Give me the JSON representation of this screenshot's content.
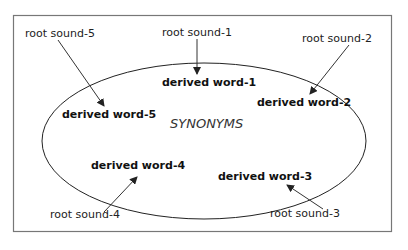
{
  "diagram": {
    "center_label": "SYNONYMS",
    "root_sounds": [
      "root sound-1",
      "root sound-2",
      "root sound-3",
      "root sound-4",
      "root sound-5"
    ],
    "derived_words": [
      "derived word-1",
      "derived word-2",
      "derived word-3",
      "derived word-4",
      "derived word-5"
    ],
    "colors": {
      "frame": "#666666",
      "line": "#333333",
      "background": "#ffffff"
    }
  }
}
